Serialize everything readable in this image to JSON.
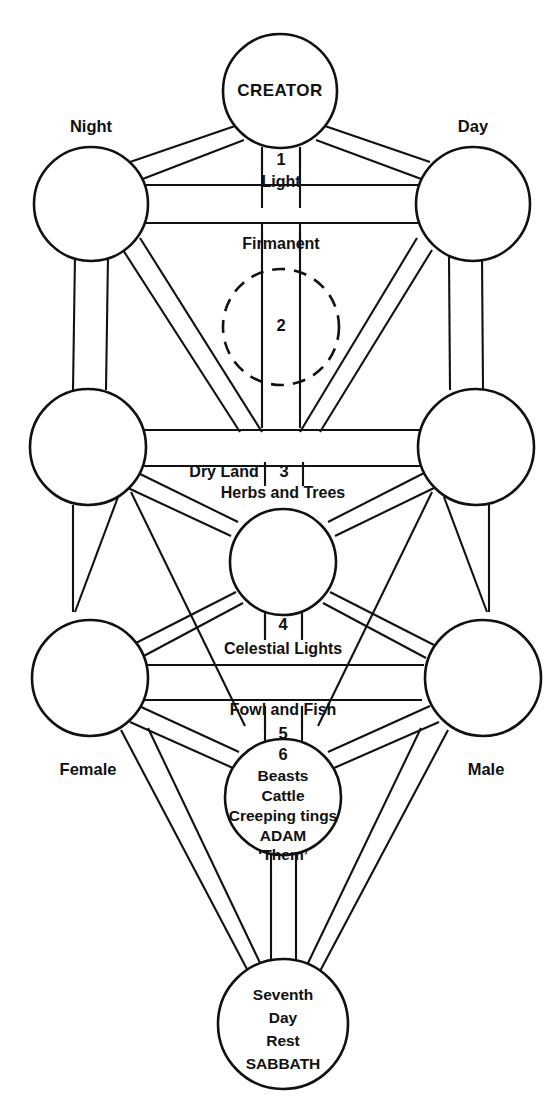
{
  "diagram": {
    "stroke_color": "#111111",
    "background_color": "#ffffff",
    "nodes": {
      "creator": {
        "label": "CREATOR"
      },
      "night": {
        "label": "Night"
      },
      "day": {
        "label": "Day"
      },
      "female": {
        "label": "Female"
      },
      "male": {
        "label": "Male"
      },
      "adam": {
        "line1": "Beasts",
        "line2": "Cattle",
        "line3": "Creeping tings",
        "line4": "ADAM",
        "line5": "‘Them’"
      },
      "sabbath": {
        "line1": "Seventh",
        "line2": "Day",
        "line3": "Rest",
        "line4": "SABBATH"
      }
    },
    "paths": [
      {
        "number": "1",
        "label": "Light"
      },
      {
        "number": "2",
        "label": "Firmanent"
      },
      {
        "number": "3",
        "label_left": "Dry Land",
        "label_below": "Herbs and Trees"
      },
      {
        "number": "4",
        "label": "Celestial Lights"
      },
      {
        "number": "5",
        "label": "Fowl and Fish"
      },
      {
        "number": "6",
        "label": ""
      }
    ],
    "path_numbers": {
      "one": "1",
      "two": "2",
      "three": "3",
      "four": "4",
      "five": "5",
      "six": "6"
    },
    "path_labels": {
      "light": "Light",
      "firmanent": "Firmanent",
      "dry_land": "Dry Land",
      "herbs_and_trees": "Herbs and Trees",
      "celestial_lights": "Celestial Lights",
      "fowl_and_fish": "Fowl and Fish"
    }
  }
}
